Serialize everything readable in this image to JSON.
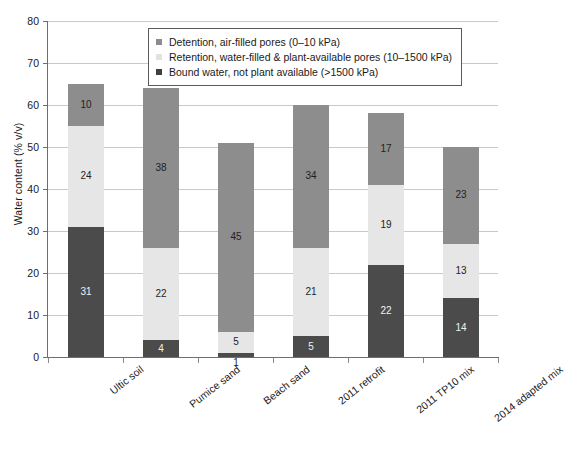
{
  "chart_data": {
    "type": "bar",
    "subtype": "stacked-bar",
    "title": "",
    "xlabel": "",
    "ylabel": "Water content (% v/v)",
    "ylim": [
      0,
      80
    ],
    "ytick_step": 10,
    "ytick_labels": [
      "0",
      "10",
      "20",
      "30",
      "40",
      "50",
      "60",
      "70",
      "80"
    ],
    "grid": "horizontal",
    "legend_position": "top-center-inside",
    "categories": [
      "Ultic soil",
      "Pumice sand",
      "Beach sand",
      "2011 retrofit",
      "2011 TP10 mix",
      "2014 adapted mix"
    ],
    "series": [
      {
        "name": "Bound water, not plant available (>1500 kPa)",
        "key": "bound",
        "color": "#4b4b4b",
        "values": [
          31,
          4,
          1,
          5,
          22,
          14
        ]
      },
      {
        "name": "Retention, water-filled & plant-available pores (10–1500 kPa)",
        "key": "retention",
        "color": "#e6e6e6",
        "values": [
          24,
          22,
          5,
          21,
          19,
          13
        ]
      },
      {
        "name": "Detention, air-filled pores (0–10 kPa)",
        "key": "detention",
        "color": "#8d8d8d",
        "values": [
          10,
          38,
          45,
          34,
          17,
          23
        ]
      }
    ],
    "totals": [
      65,
      64,
      51,
      60,
      58,
      50
    ],
    "legend_order": [
      "Detention, air-filled pores (0–10 kPa)",
      "Retention, water-filled & plant-available pores (10–1500 kPa)",
      "Bound water, not plant available (>1500 kPa)"
    ]
  },
  "legend": {
    "items": [
      {
        "label": "Detention, air-filled pores (0–10 kPa)",
        "swatch": "detention"
      },
      {
        "label": "Retention, water-filled & plant-available pores (10–1500 kPa)",
        "swatch": "retention"
      },
      {
        "label": "Bound water, not plant available (>1500 kPa)",
        "swatch": "bound"
      }
    ]
  },
  "axes": {
    "y_title": "Water content (% v/v)",
    "y_ticks": [
      "80",
      "70",
      "60",
      "50",
      "40",
      "30",
      "20",
      "10",
      "0"
    ]
  }
}
